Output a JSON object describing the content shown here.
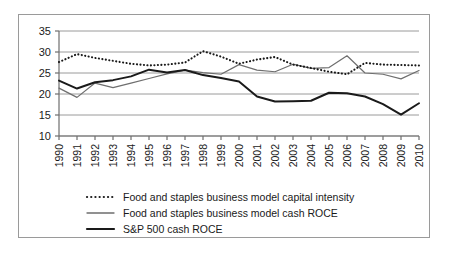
{
  "chart_data": {
    "type": "line",
    "title": "",
    "subtitle": "",
    "xlabel": "",
    "ylabel": "",
    "x": [
      1990,
      1991,
      1992,
      1993,
      1994,
      1995,
      1996,
      1997,
      1998,
      1999,
      2000,
      2001,
      2002,
      2003,
      2004,
      2005,
      2006,
      2007,
      2008,
      2009,
      2010
    ],
    "categories": [
      "1990",
      "1991",
      "1992",
      "1993",
      "1994",
      "1995",
      "1996",
      "1997",
      "1998",
      "1999",
      "2000",
      "2001",
      "2002",
      "2003",
      "2004",
      "2005",
      "2006",
      "2007",
      "2008",
      "2009",
      "2010"
    ],
    "ylim": [
      10,
      35
    ],
    "yticks": [
      10,
      15,
      20,
      25,
      30,
      35
    ],
    "ytick_labels": [
      "10",
      "15",
      "20",
      "25",
      "30",
      "35"
    ],
    "grid": "horizontal",
    "legend_position": "below-axes",
    "series": [
      {
        "name": "Food and staples business model capital intensity",
        "style": "dotted",
        "color": "#1a1a1a",
        "values": [
          27.6,
          29.5,
          28.6,
          27.9,
          27.2,
          26.8,
          27.0,
          27.5,
          30.2,
          28.9,
          27.2,
          28.2,
          28.8,
          27.0,
          26.2,
          25.3,
          24.7,
          27.4,
          27.0,
          26.9,
          26.8
        ]
      },
      {
        "name": "Food and staples business model cash ROCE",
        "style": "solid-thin",
        "color": "#6e6e6e",
        "values": [
          21.4,
          19.2,
          22.6,
          21.5,
          22.6,
          23.7,
          24.8,
          25.7,
          25.1,
          24.7,
          27.0,
          25.7,
          25.3,
          27.1,
          26.1,
          26.3,
          29.1,
          25.0,
          24.7,
          23.6,
          25.6
        ]
      },
      {
        "name": "S&P 500 cash ROCE",
        "style": "solid-thick",
        "color": "#1a1a1a",
        "values": [
          23.2,
          21.3,
          22.8,
          23.3,
          24.2,
          25.8,
          25.1,
          25.7,
          24.5,
          23.8,
          23.0,
          19.4,
          18.2,
          18.3,
          18.4,
          20.3,
          20.2,
          19.4,
          17.6,
          15.1,
          17.8
        ]
      }
    ]
  },
  "legend": {
    "items": [
      {
        "label": "Food and staples business model capital intensity",
        "swatch": "dotted-line-swatch"
      },
      {
        "label": "Food and staples business model cash ROCE",
        "swatch": "thin-line-swatch"
      },
      {
        "label": "S&P 500 cash ROCE",
        "swatch": "thick-line-swatch"
      }
    ]
  },
  "colors": {
    "frame": "#9a9a9a",
    "grid": "#9a9a9a",
    "axis": "#6e6e6e",
    "text": "#1a1a1a",
    "series_dotted": "#1a1a1a",
    "series_thin": "#6e6e6e",
    "series_thick": "#1a1a1a"
  }
}
